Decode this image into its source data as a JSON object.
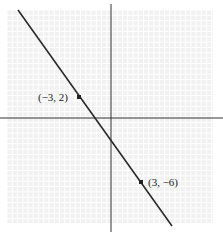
{
  "figure": {
    "caption": "Figure 10",
    "points": [
      {
        "label": "(−3, 2)",
        "x": -3,
        "y": 2
      },
      {
        "label": "(3, −6)",
        "x": 3,
        "y": -6
      }
    ],
    "line": {
      "slope": -1.3333,
      "intercept": -2
    }
  },
  "colors": {
    "grid": "#e4e4e4",
    "background": "#f2f2f2",
    "axis": "#333333",
    "line": "#2a2a2a"
  }
}
